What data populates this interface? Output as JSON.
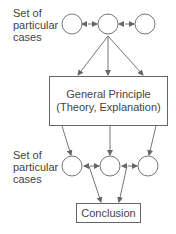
{
  "top_group": {
    "label_lines": [
      "Set of",
      "particular",
      "cases"
    ]
  },
  "principle_box": {
    "line1": "General Principle",
    "line2": "(Theory, Explanation)"
  },
  "bottom_group": {
    "label_lines": [
      "Set of",
      "particular",
      "cases"
    ]
  },
  "conclusion_box": {
    "label": "Conclusion"
  },
  "colors": {
    "stroke": "#666666",
    "text": "#444444"
  }
}
